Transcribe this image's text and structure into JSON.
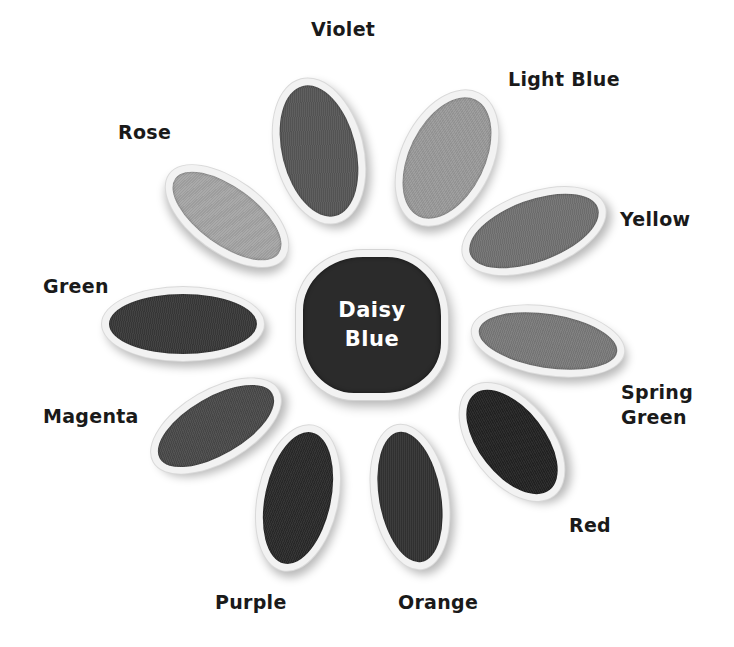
{
  "figure": {
    "center": {
      "line1": "Daisy",
      "line2": "Blue",
      "color": "#2b2b2b"
    },
    "petals": [
      {
        "id": "violet",
        "label": "Violet",
        "color": "#575757"
      },
      {
        "id": "light-blue",
        "label": "Light Blue",
        "color": "#9a9a9a"
      },
      {
        "id": "yellow",
        "label": "Yellow",
        "color": "#727272"
      },
      {
        "id": "spring-green",
        "label": "Spring Green",
        "label_line1": "Spring",
        "label_line2": "Green",
        "color": "#7a7a7a"
      },
      {
        "id": "red",
        "label": "Red",
        "color": "#232323"
      },
      {
        "id": "orange",
        "label": "Orange",
        "color": "#333333"
      },
      {
        "id": "purple",
        "label": "Purple",
        "color": "#2a2a2a"
      },
      {
        "id": "magenta",
        "label": "Magenta",
        "color": "#4a4a4a"
      },
      {
        "id": "green",
        "label": "Green",
        "color": "#393939"
      },
      {
        "id": "rose",
        "label": "Rose",
        "color": "#a5a5a5"
      }
    ]
  }
}
